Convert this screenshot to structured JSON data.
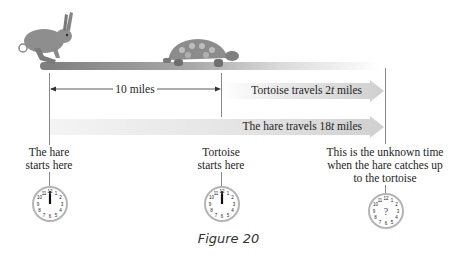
{
  "figure": {
    "caption": "Figure 20",
    "distance_label": "10 miles",
    "tortoise_band_label_prefix": "Tortoise travels 2",
    "tortoise_band_var": "t",
    "tortoise_band_label_suffix": " miles",
    "hare_band_label_prefix": "The hare travels 18",
    "hare_band_var": "t",
    "hare_band_label_suffix": " miles",
    "hare_start": {
      "line1": "The hare",
      "line2": "starts here"
    },
    "tortoise_start": {
      "line1": "Tortoise",
      "line2": "starts here"
    },
    "catch_up": {
      "line1": "This is the unknown time",
      "line2": "when the hare catches up",
      "line3": "to the tortoise"
    },
    "clocks": [
      {
        "name": "hare-start-clock",
        "time": "12:00",
        "center_text": ""
      },
      {
        "name": "tortoise-start-clock",
        "time": "12:00",
        "center_text": ""
      },
      {
        "name": "unknown-time-clock",
        "time": "unknown",
        "center_text": "?"
      }
    ],
    "clock_numbers": [
      "12",
      "1",
      "2",
      "3",
      "4",
      "5",
      "6",
      "7",
      "8",
      "9",
      "10",
      "11"
    ],
    "colors": {
      "band": "#d6d6d6",
      "line": "#8a8a8a",
      "ground": "#9a9a9a",
      "clock_rim": "#b5b5b5"
    }
  }
}
